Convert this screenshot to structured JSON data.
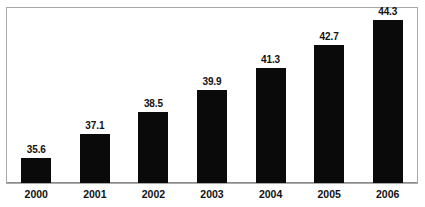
{
  "chart_data": {
    "type": "bar",
    "title": "",
    "subtitle": "",
    "xlabel": "",
    "ylabel": "",
    "categories": [
      "2000",
      "2001",
      "2002",
      "2003",
      "2004",
      "2005",
      "2006"
    ],
    "values": [
      35.6,
      37.1,
      38.5,
      39.9,
      41.3,
      42.7,
      44.3
    ],
    "data_labels": [
      "35.6",
      "37.1",
      "38.5",
      "39.9",
      "41.3",
      "42.7",
      "44.3"
    ],
    "series": [
      {
        "name": "",
        "values": [
          35.6,
          37.1,
          38.5,
          39.9,
          41.3,
          42.7,
          44.3
        ],
        "color": "#0a0a0a"
      }
    ],
    "ylim": [
      34.0,
      45.0
    ],
    "grid": false,
    "legend": null,
    "legend_position": "none",
    "y_axis_visible": false,
    "y_tick_labels": [],
    "x_axis_visible": true,
    "annotations": [],
    "colors": {
      "bar": "#0a0a0a",
      "frame": "#a9a9a9",
      "axis": "#8a8a8a",
      "text": "#111111",
      "background": "#ffffff"
    }
  }
}
